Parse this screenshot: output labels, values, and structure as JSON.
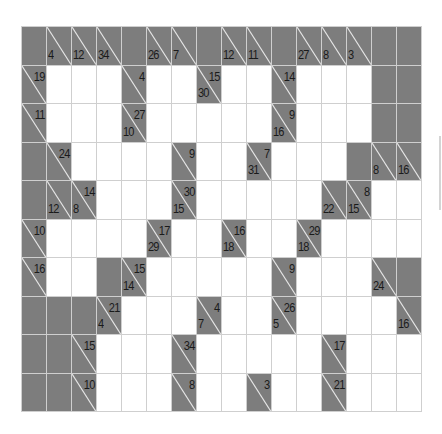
{
  "puzzle": {
    "type": "kakuro",
    "rows": 10,
    "cols": 16,
    "colors": {
      "block": "#7d7d7d",
      "cell": "#ffffff",
      "grid": "#cfcfcf",
      "text": "#1a1a1a"
    },
    "grid": [
      [
        {
          "t": "b"
        },
        {
          "t": "c",
          "d": "4"
        },
        {
          "t": "c",
          "d": "12"
        },
        {
          "t": "c",
          "d": "34"
        },
        {
          "t": "b"
        },
        {
          "t": "c",
          "d": "26"
        },
        {
          "t": "c",
          "d": "7"
        },
        {
          "t": "b"
        },
        {
          "t": "c",
          "d": "12"
        },
        {
          "t": "c",
          "d": "11"
        },
        {
          "t": "b"
        },
        {
          "t": "c",
          "d": "27"
        },
        {
          "t": "c",
          "d": "8"
        },
        {
          "t": "c",
          "d": "3"
        },
        {
          "t": "b"
        },
        {
          "t": "b"
        }
      ],
      [
        {
          "t": "c",
          "a": "19"
        },
        {
          "t": "w"
        },
        {
          "t": "w"
        },
        {
          "t": "w"
        },
        {
          "t": "c",
          "a": "4"
        },
        {
          "t": "w"
        },
        {
          "t": "w"
        },
        {
          "t": "c",
          "a": "15",
          "d": "30"
        },
        {
          "t": "w"
        },
        {
          "t": "w"
        },
        {
          "t": "c",
          "a": "14"
        },
        {
          "t": "w"
        },
        {
          "t": "w"
        },
        {
          "t": "w"
        },
        {
          "t": "b"
        },
        {
          "t": "b"
        }
      ],
      [
        {
          "t": "c",
          "a": "11"
        },
        {
          "t": "w"
        },
        {
          "t": "w"
        },
        {
          "t": "w"
        },
        {
          "t": "c",
          "a": "27",
          "d": "10"
        },
        {
          "t": "w"
        },
        {
          "t": "w"
        },
        {
          "t": "w"
        },
        {
          "t": "w"
        },
        {
          "t": "w"
        },
        {
          "t": "c",
          "a": "9",
          "d": "16"
        },
        {
          "t": "w"
        },
        {
          "t": "w"
        },
        {
          "t": "w"
        },
        {
          "t": "b"
        },
        {
          "t": "b"
        }
      ],
      [
        {
          "t": "b"
        },
        {
          "t": "c",
          "a": "24"
        },
        {
          "t": "w"
        },
        {
          "t": "w"
        },
        {
          "t": "w"
        },
        {
          "t": "w"
        },
        {
          "t": "c",
          "a": "9"
        },
        {
          "t": "w"
        },
        {
          "t": "w"
        },
        {
          "t": "c",
          "a": "7",
          "d": "31"
        },
        {
          "t": "w"
        },
        {
          "t": "w"
        },
        {
          "t": "w"
        },
        {
          "t": "b"
        },
        {
          "t": "c",
          "d": "8"
        },
        {
          "t": "c",
          "d": "16"
        }
      ],
      [
        {
          "t": "b"
        },
        {
          "t": "c",
          "d": "12"
        },
        {
          "t": "c",
          "a": "14",
          "d": "8"
        },
        {
          "t": "w"
        },
        {
          "t": "w"
        },
        {
          "t": "w"
        },
        {
          "t": "c",
          "a": "30",
          "d": "15"
        },
        {
          "t": "w"
        },
        {
          "t": "w"
        },
        {
          "t": "w"
        },
        {
          "t": "w"
        },
        {
          "t": "w"
        },
        {
          "t": "c",
          "d": "22"
        },
        {
          "t": "c",
          "a": "8",
          "d": "15"
        },
        {
          "t": "w"
        },
        {
          "t": "w"
        }
      ],
      [
        {
          "t": "c",
          "a": "10"
        },
        {
          "t": "w"
        },
        {
          "t": "w"
        },
        {
          "t": "w"
        },
        {
          "t": "w"
        },
        {
          "t": "c",
          "a": "17",
          "d": "29"
        },
        {
          "t": "w"
        },
        {
          "t": "w"
        },
        {
          "t": "c",
          "a": "16",
          "d": "18"
        },
        {
          "t": "w"
        },
        {
          "t": "w"
        },
        {
          "t": "c",
          "a": "29",
          "d": "18"
        },
        {
          "t": "w"
        },
        {
          "t": "w"
        },
        {
          "t": "w"
        },
        {
          "t": "w"
        }
      ],
      [
        {
          "t": "c",
          "a": "16"
        },
        {
          "t": "w"
        },
        {
          "t": "w"
        },
        {
          "t": "b"
        },
        {
          "t": "c",
          "a": "15",
          "d": "14"
        },
        {
          "t": "w"
        },
        {
          "t": "w"
        },
        {
          "t": "w"
        },
        {
          "t": "w"
        },
        {
          "t": "w"
        },
        {
          "t": "c",
          "a": "9"
        },
        {
          "t": "w"
        },
        {
          "t": "w"
        },
        {
          "t": "w"
        },
        {
          "t": "c",
          "d": "24"
        },
        {
          "t": "b"
        }
      ],
      [
        {
          "t": "b"
        },
        {
          "t": "b"
        },
        {
          "t": "b"
        },
        {
          "t": "c",
          "a": "21",
          "d": "4"
        },
        {
          "t": "w"
        },
        {
          "t": "w"
        },
        {
          "t": "w"
        },
        {
          "t": "c",
          "a": "4",
          "d": "7"
        },
        {
          "t": "w"
        },
        {
          "t": "w"
        },
        {
          "t": "c",
          "a": "26",
          "d": "5"
        },
        {
          "t": "w"
        },
        {
          "t": "w"
        },
        {
          "t": "w"
        },
        {
          "t": "w"
        },
        {
          "t": "c",
          "d": "16"
        }
      ],
      [
        {
          "t": "b"
        },
        {
          "t": "b"
        },
        {
          "t": "c",
          "a": "15"
        },
        {
          "t": "w"
        },
        {
          "t": "w"
        },
        {
          "t": "w"
        },
        {
          "t": "c",
          "a": "34"
        },
        {
          "t": "w"
        },
        {
          "t": "w"
        },
        {
          "t": "w"
        },
        {
          "t": "w"
        },
        {
          "t": "w"
        },
        {
          "t": "c",
          "a": "17"
        },
        {
          "t": "w"
        },
        {
          "t": "w"
        },
        {
          "t": "w"
        }
      ],
      [
        {
          "t": "b"
        },
        {
          "t": "b"
        },
        {
          "t": "c",
          "a": "10"
        },
        {
          "t": "w"
        },
        {
          "t": "w"
        },
        {
          "t": "w"
        },
        {
          "t": "c",
          "a": "8"
        },
        {
          "t": "w"
        },
        {
          "t": "w"
        },
        {
          "t": "c",
          "a": "3"
        },
        {
          "t": "w"
        },
        {
          "t": "w"
        },
        {
          "t": "c",
          "a": "21"
        },
        {
          "t": "w"
        },
        {
          "t": "w"
        },
        {
          "t": "w"
        }
      ]
    ]
  },
  "legend": {
    "w": "empty-entry-cell",
    "b": "blocked-cell",
    "c": "clue-cell",
    "a": "across-sum",
    "d": "down-sum"
  }
}
